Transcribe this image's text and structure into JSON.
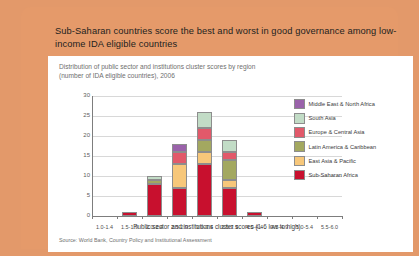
{
  "headline": "Sub-Saharan countries score the best and worst in good governance among low-income IDA eligible countries",
  "panel": {
    "subtitle_line1": "Distribution of public sector and institutions cluster scores by region",
    "subtitle_line2": "(number of IDA eligible countries), 2006",
    "source": "Source: World Bank, Country Policy and Institutional Assessment"
  },
  "chart_data": {
    "type": "bar",
    "stacked": true,
    "title": "Distribution of public sector and institutions cluster scores by region (number of IDA eligible countries), 2006",
    "xlabel": "Public sector and institutions cluster scores (1-6 low to high)",
    "ylabel": "",
    "ylim": [
      0,
      30
    ],
    "yticks": [
      0,
      5,
      10,
      15,
      20,
      25,
      30
    ],
    "grid": true,
    "legend_position": "right",
    "categories": [
      "1.0-1.4",
      "1.5-1.9",
      "2.0-2.4",
      "2.5-2.9",
      "3.0-3.4",
      "3.5-3.9",
      "4.0-4.4",
      "4.5-4.9",
      "5.0-5.4",
      "5.5-6.0"
    ],
    "series": [
      {
        "name": "Sub-Saharan Africa",
        "color": "#c8102e",
        "values": [
          0,
          1,
          8,
          7,
          13,
          7,
          1,
          0,
          0,
          0
        ]
      },
      {
        "name": "East Asia & Pacific",
        "color": "#f7c77a",
        "values": [
          0,
          0,
          0,
          6,
          3,
          2,
          0,
          0,
          0,
          0
        ]
      },
      {
        "name": "Latin America & Caribbean",
        "color": "#a3a860",
        "values": [
          0,
          0,
          1,
          0,
          3,
          5,
          0,
          0,
          0,
          0
        ]
      },
      {
        "name": "Europe & Central Asia",
        "color": "#e2596a",
        "values": [
          0,
          0,
          0,
          3,
          3,
          2,
          0,
          0,
          0,
          0
        ]
      },
      {
        "name": "South Asia",
        "color": "#c2dcc6",
        "values": [
          0,
          0,
          1,
          0,
          4,
          3,
          0,
          0,
          0,
          0
        ]
      },
      {
        "name": "Middle East & North Africa",
        "color": "#9a62aa",
        "values": [
          0,
          0,
          0,
          2,
          0,
          0,
          0,
          0,
          0,
          0
        ]
      }
    ],
    "totals": [
      0,
      1,
      10,
      18,
      26,
      19,
      1,
      0,
      0,
      0
    ]
  },
  "legend": [
    {
      "label": "Middle East & North Africa",
      "color": "#9a62aa"
    },
    {
      "label": "South Asia",
      "color": "#c2dcc6"
    },
    {
      "label": "Europe & Central Asia",
      "color": "#e2596a"
    },
    {
      "label": "Latin America & Caribbean",
      "color": "#a3a860"
    },
    {
      "label": "East Asia & Pacific",
      "color": "#f7c77a"
    },
    {
      "label": "Sub-Saharan Africa",
      "color": "#c8102e"
    }
  ],
  "colors": {
    "card_background": "#e59a6a",
    "panel_background": "#ffffff",
    "text": "#231f20",
    "muted_text": "#6f6f6f"
  }
}
